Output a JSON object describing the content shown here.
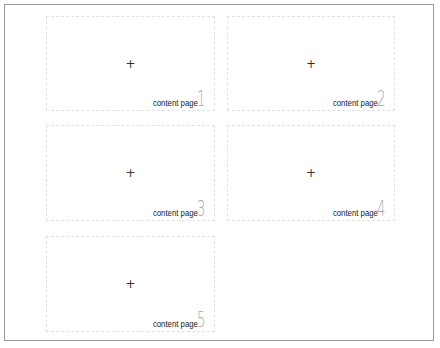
{
  "pages": [
    {
      "label": "content page",
      "number": "1",
      "icon": "+"
    },
    {
      "label": "content page",
      "number": "2",
      "icon": "+"
    },
    {
      "label": "content page",
      "number": "3",
      "icon": "+"
    },
    {
      "label": "content page",
      "number": "4",
      "icon": "+"
    },
    {
      "label": "content page",
      "number": "5",
      "icon": "+"
    }
  ]
}
